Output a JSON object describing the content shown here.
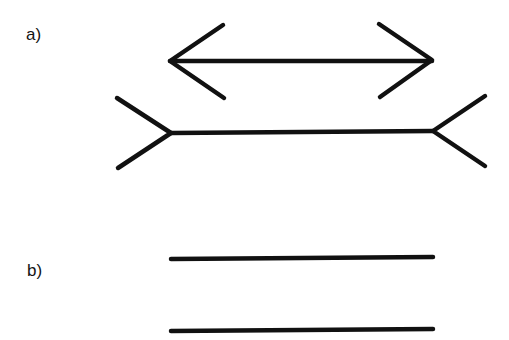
{
  "figure": {
    "stroke_color": "#111111",
    "background": "#ffffff"
  },
  "panel_a": {
    "label": "a)",
    "figures": [
      {
        "name": "arrowheads-inward",
        "shaft": [
          170,
          61,
          432,
          61
        ],
        "left_fins": [
          [
            223,
            25
          ],
          [
            224,
            98
          ]
        ],
        "right_fins": [
          [
            379,
            24
          ],
          [
            380,
            97
          ]
        ]
      },
      {
        "name": "arrowheads-outward",
        "shaft": [
          171,
          133,
          433,
          131
        ],
        "left_fins": [
          [
            117,
            98
          ],
          [
            118,
            168
          ]
        ],
        "right_fins": [
          [
            485,
            96
          ],
          [
            485,
            166
          ]
        ]
      }
    ]
  },
  "panel_b": {
    "label": "b)",
    "lines": [
      {
        "name": "line-top",
        "coords": [
          171,
          259,
          433,
          257
        ]
      },
      {
        "name": "line-bottom",
        "coords": [
          171,
          331,
          433,
          329
        ]
      }
    ]
  }
}
